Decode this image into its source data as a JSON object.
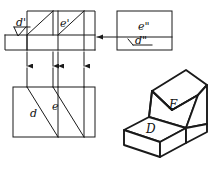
{
  "drawing": {
    "title": "Orthographic projection with isometric pictorial",
    "line_color": "#1a1a1a",
    "background": "#ffffff"
  },
  "front_view": {
    "name": "front-view",
    "label_d": "d'",
    "label_e": "e'"
  },
  "side_view": {
    "name": "side-view",
    "label_e": "e\"",
    "label_d": "d\""
  },
  "top_view": {
    "name": "top-view",
    "label_d": "d",
    "label_e": "e"
  },
  "pictorial": {
    "name": "isometric-solid",
    "face_upper": "E",
    "face_lower": "D"
  },
  "projection": {
    "horizontal_arrow": "arrow-right",
    "vertical_arrows": 4
  }
}
